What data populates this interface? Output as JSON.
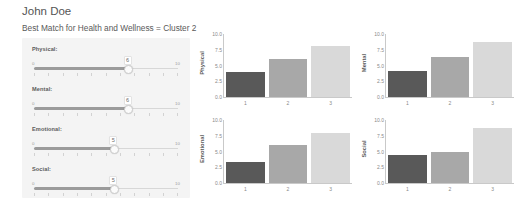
{
  "header": {
    "user_name": "John Doe",
    "cluster_line": "Best Match for Health and Wellness = Cluster 2"
  },
  "sliders": {
    "min_label": "0",
    "max_label": "10",
    "tick_count": 11,
    "items": [
      {
        "label": "Physical:",
        "value": "6",
        "percent": 65
      },
      {
        "label": "Mental:",
        "value": "6",
        "percent": 65
      },
      {
        "label": "Emotional:",
        "value": "5",
        "percent": 55
      },
      {
        "label": "Social:",
        "value": "5",
        "percent": 55
      }
    ]
  },
  "colors": {
    "bar_cluster_1": "#595959",
    "bar_cluster_2": "#a8a8a8",
    "bar_cluster_3": "#d9d9d9",
    "panel_background": "#f4f4f4",
    "slider_fill": "#9b9b9b"
  },
  "chart_data": [
    {
      "type": "bar",
      "title": "",
      "ylabel": "Physical",
      "xlabel": "",
      "categories": [
        "1",
        "2",
        "3"
      ],
      "values": [
        4.0,
        6.0,
        8.1
      ],
      "ylim": [
        0,
        10
      ],
      "yticks": [
        "10.0",
        "7.5",
        "5.0",
        "2.5",
        "0.0"
      ],
      "grid": false,
      "legend": "none"
    },
    {
      "type": "bar",
      "title": "",
      "ylabel": "Mental",
      "xlabel": "",
      "categories": [
        "1",
        "2",
        "3"
      ],
      "values": [
        4.2,
        6.4,
        8.7
      ],
      "ylim": [
        0,
        10
      ],
      "yticks": [
        "10.0",
        "7.5",
        "5.0",
        "2.5",
        "0.0"
      ],
      "grid": false,
      "legend": "none"
    },
    {
      "type": "bar",
      "title": "",
      "ylabel": "Emotional",
      "xlabel": "",
      "categories": [
        "1",
        "2",
        "3"
      ],
      "values": [
        3.4,
        6.0,
        8.0
      ],
      "ylim": [
        0,
        10
      ],
      "yticks": [
        "10.0",
        "7.5",
        "5.0",
        "2.5",
        "0.0"
      ],
      "grid": false,
      "legend": "none"
    },
    {
      "type": "bar",
      "title": "",
      "ylabel": "Social",
      "xlabel": "",
      "categories": [
        "1",
        "2",
        "3"
      ],
      "values": [
        4.4,
        5.0,
        8.7
      ],
      "ylim": [
        0,
        10
      ],
      "yticks": [
        "10.0",
        "7.5",
        "5.0",
        "2.5",
        "0.0"
      ],
      "grid": false,
      "legend": "none"
    }
  ]
}
